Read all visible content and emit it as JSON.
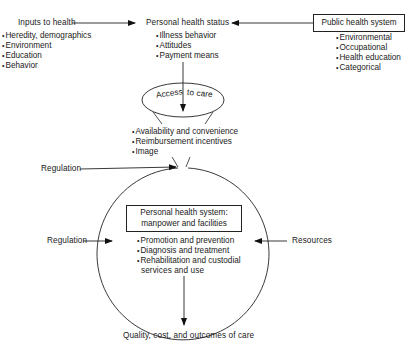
{
  "inputs_to_health": {
    "title": "Inputs to health",
    "items": [
      "Heredity, demographics",
      "Environment",
      "Education",
      "Behavior"
    ]
  },
  "personal_health_status": {
    "title": "Personal health status",
    "items": [
      "Illness behavior",
      "Attitudes",
      "Payment means"
    ]
  },
  "public_health_system": {
    "title": "Public health system",
    "items": [
      "Environmental",
      "Occupational",
      "Health education",
      "Categorical"
    ]
  },
  "access_to_care": {
    "label_left": "Access",
    "label_right": "to care",
    "items": [
      "Availability and convenience",
      "Reimbursement incentives",
      "Image"
    ]
  },
  "regulation_top": {
    "label": "Regulation"
  },
  "regulation_left": {
    "label": "Regulation"
  },
  "resources": {
    "label": "Resources"
  },
  "personal_health_system": {
    "title_line1": "Personal health system:",
    "title_line2": "manpower and facilities",
    "items": [
      "Promotion and prevention",
      "Diagnosis and treatment",
      "Rehabilitation and custodial"
    ],
    "item_continuation": "services and use"
  },
  "outcome": {
    "label": "Quality, cost, and outcomes of care"
  }
}
